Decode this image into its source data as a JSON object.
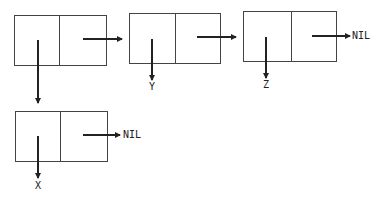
{
  "diagram": {
    "type": "cons-cell list structure",
    "cells": [
      {
        "id": "cell1",
        "car": "cell4",
        "cdr": "cell2"
      },
      {
        "id": "cell2",
        "car": "Y",
        "cdr": "cell3"
      },
      {
        "id": "cell3",
        "car": "Z",
        "cdr": "NIL"
      },
      {
        "id": "cell4",
        "car": "X",
        "cdr": "NIL"
      }
    ],
    "labels": {
      "y": "Y",
      "z": "Z",
      "x": "X",
      "nil_top": "NIL",
      "nil_bottom": "NIL"
    },
    "colors": {
      "line": "#222222",
      "background": "#ffffff"
    }
  }
}
